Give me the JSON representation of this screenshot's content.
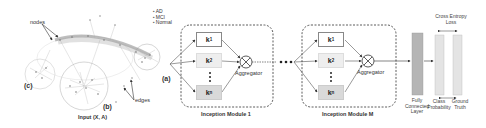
{
  "input_graph": {
    "caption": "Input (X, A)",
    "labels": {
      "nodes": "nodes",
      "edges": "edges",
      "a": "(a)",
      "b": "(b)",
      "c": "(c)"
    },
    "legend": [
      "AD",
      "MCI",
      "Normal"
    ]
  },
  "modules": [
    {
      "title": "Inception Module 1",
      "kernels": [
        {
          "label": "k",
          "sub": "1"
        },
        {
          "label": "k",
          "sub": "2"
        },
        {
          "label": "k",
          "sub": "n"
        }
      ],
      "aggregator": "Aggregator"
    },
    {
      "title": "Inception Module M",
      "kernels": [
        {
          "label": "k",
          "sub": "1"
        },
        {
          "label": "k",
          "sub": "2"
        },
        {
          "label": "k",
          "sub": "n"
        }
      ],
      "aggregator": "Aggregator"
    }
  ],
  "output": {
    "fc_layer": "Fully Connected Layer",
    "class_probability": "Class Probability",
    "ground_truth": "Ground Truth",
    "loss": "Cross Entropy Loss"
  },
  "colors": {
    "k1_fill": "#ffffff",
    "k2_fill": "#eeeeee",
    "kn_fill": "#d9d9d9",
    "fc_fill": "#b5b5b5",
    "prob_fill": "#e4e4e4",
    "graph_edges": "#999999"
  }
}
